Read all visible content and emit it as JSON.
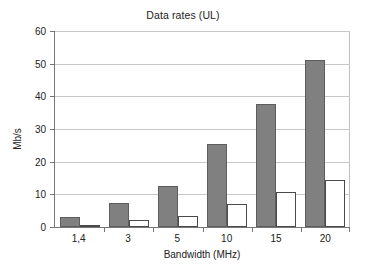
{
  "chart_data": {
    "type": "bar",
    "title": "Data rates (UL)",
    "xlabel": "Bandwidth (MHz)",
    "ylabel": "Mb/s",
    "categories": [
      "1,4",
      "3",
      "5",
      "10",
      "15",
      "20"
    ],
    "series": [
      {
        "name": "series-a",
        "color": "#808080",
        "values": [
          3.0,
          7.5,
          12.5,
          25.5,
          37.8,
          51.0
        ]
      },
      {
        "name": "series-b",
        "color": "#ffffff",
        "values": [
          0.5,
          2.0,
          3.3,
          7.0,
          10.6,
          14.5
        ]
      }
    ],
    "ylim": [
      0,
      60
    ],
    "yticks": [
      0,
      10,
      20,
      30,
      40,
      50,
      60
    ],
    "ytick_labels": [
      "0",
      "10",
      "20",
      "30",
      "40",
      "50",
      "60"
    ],
    "grid": true,
    "legend": null,
    "legend_position": "none"
  }
}
